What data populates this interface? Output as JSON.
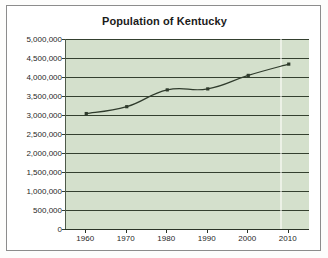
{
  "chart_data": {
    "type": "line",
    "title": "Population of Kentucky",
    "xlabel": "",
    "ylabel": "",
    "x": [
      1960,
      1970,
      1980,
      1990,
      2000,
      2010
    ],
    "categories": [
      "1960",
      "1970",
      "1980",
      "1990",
      "2000",
      "2010"
    ],
    "series": [
      {
        "name": "Population of Kentucky",
        "values": [
          3038000,
          3219000,
          3661000,
          3687000,
          4042000,
          4339000
        ]
      }
    ],
    "xlim": [
      1955,
      2015
    ],
    "ylim": [
      0,
      5000000
    ],
    "ytick_values": [
      0,
      500000,
      1000000,
      1500000,
      2000000,
      2500000,
      3000000,
      3500000,
      4000000,
      4500000,
      5000000
    ],
    "ytick_labels": [
      "0",
      "500,000",
      "1,000,000",
      "1,500,000",
      "2,000,000",
      "2,500,000",
      "3,000,000",
      "3,500,000",
      "4,000,000",
      "4,500,000",
      "5,000,000"
    ],
    "xtick_labels": [
      "1960",
      "1970",
      "1980",
      "1990",
      "2000",
      "2010"
    ],
    "grid": "horizontal",
    "legend": "none",
    "smoothed": true,
    "marker": "square",
    "colors": {
      "plot_background": "#d4e0cc",
      "gridline": "#34402f",
      "series_line": "#2f3b2c",
      "axis": "#2b3427",
      "title_text": "#1b1b1b",
      "tick_text": "#1f1f1f",
      "frame_border": "#8c8c8c",
      "page_background": "#fdfdfc"
    }
  }
}
